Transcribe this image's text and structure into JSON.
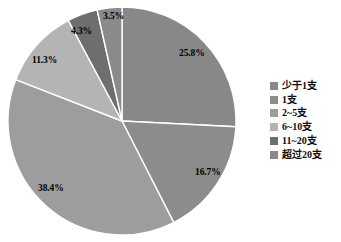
{
  "chart_data": {
    "type": "pie",
    "title": "",
    "subtitle": "",
    "xlabel": "",
    "ylabel": "",
    "legend_position": "right",
    "grid": false,
    "start_angle_deg": 0,
    "direction": "clockwise",
    "categories": [
      "少于1支",
      "1支",
      "2~5支",
      "6~10支",
      "11~20支",
      "超过20支"
    ],
    "values": [
      25.8,
      16.7,
      38.4,
      11.3,
      4.3,
      3.5
    ],
    "value_unit": "%",
    "data_labels": [
      "25.8%",
      "16.7%",
      "38.4%",
      "11.3%",
      "4.3%",
      "3.5%"
    ],
    "colors": [
      "#888888",
      "#8c8c8c",
      "#9d9d9d",
      "#b4b4b4",
      "#6e6e6e",
      "#8a8a8a"
    ],
    "slices": [
      {
        "label": "少于1支",
        "value": 25.8,
        "data_label": "25.8%",
        "color": "#888888",
        "start_deg": 0,
        "end_deg": 92.88,
        "label_x": 179,
        "label_y": 49
      },
      {
        "label": "1支",
        "value": 16.7,
        "data_label": "16.7%",
        "color": "#8c8c8c",
        "start_deg": 92.88,
        "end_deg": 152.99,
        "label_x": 195,
        "label_y": 168
      },
      {
        "label": "2~5支",
        "value": 38.4,
        "data_label": "38.4%",
        "color": "#9d9d9d",
        "start_deg": 152.99,
        "end_deg": 291.23,
        "label_x": 38,
        "label_y": 184
      },
      {
        "label": "6~10支",
        "value": 11.3,
        "data_label": "11.3%",
        "color": "#b4b4b4",
        "start_deg": 291.23,
        "end_deg": 331.9,
        "label_x": 32,
        "label_y": 56
      },
      {
        "label": "11~20支",
        "value": 4.3,
        "data_label": "4.3%",
        "color": "#6e6e6e",
        "start_deg": 331.9,
        "end_deg": 347.38,
        "label_x": 71,
        "label_y": 27
      },
      {
        "label": "超过20支",
        "value": 3.5,
        "data_label": "3.5%",
        "color": "#8a8a8a",
        "start_deg": 347.38,
        "end_deg": 360,
        "label_x": 103,
        "label_y": 12
      }
    ],
    "geometry": {
      "center_x": 122,
      "center_y": 121,
      "radius": 114,
      "separator_color": "#ffffff",
      "separator_width": 1.4
    }
  },
  "legend": {
    "items": [
      {
        "label": "少于1支",
        "color": "#888888"
      },
      {
        "label": "1支",
        "color": "#8c8c8c"
      },
      {
        "label": "2~5支",
        "color": "#9d9d9d"
      },
      {
        "label": "6~10支",
        "color": "#b4b4b4"
      },
      {
        "label": "11~20支",
        "color": "#6e6e6e"
      },
      {
        "label": "超过20支",
        "color": "#8a8a8a"
      }
    ]
  }
}
